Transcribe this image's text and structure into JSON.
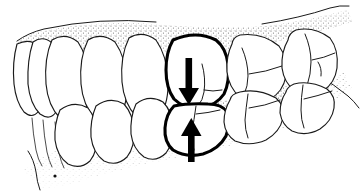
{
  "figure": {
    "domain": "medical-illustration",
    "caption": "",
    "annotations": {
      "down_arrow_label": "occlusal-force-down",
      "up_arrow_label": "occlusal-force-up",
      "highlighted_pair_label": "highlighted-occluding-tooth-pair"
    }
  },
  "canvas": {
    "width": 363,
    "height": 195,
    "background": "#ffffff"
  },
  "colors": {
    "background": "#ffffff",
    "outline": "#1a1a1a",
    "bold_outline": "#000000",
    "arrow": "#000000",
    "gum_stipple": "#555555",
    "tooth_fill": "#ffffff"
  },
  "arrows": [
    {
      "name": "down-arrow",
      "direction": "down",
      "tip_x": 189,
      "tip_y": 103,
      "tail_x": 189,
      "tail_y": 63
    },
    {
      "name": "up-arrow",
      "direction": "up",
      "tip_x": 191,
      "tip_y": 117,
      "tail_x": 191,
      "tail_y": 160
    }
  ],
  "upper_teeth": [
    {
      "name": "upper-incisor-1",
      "index": 1
    },
    {
      "name": "upper-incisor-2",
      "index": 2
    },
    {
      "name": "upper-canine",
      "index": 3
    },
    {
      "name": "upper-premolar-1",
      "index": 4
    },
    {
      "name": "upper-premolar-2",
      "index": 5
    },
    {
      "name": "upper-molar-1-highlighted",
      "index": 6,
      "highlighted": true
    },
    {
      "name": "upper-molar-2",
      "index": 7
    },
    {
      "name": "upper-molar-3",
      "index": 8
    }
  ],
  "lower_teeth": [
    {
      "name": "lower-incisor-1",
      "index": 1
    },
    {
      "name": "lower-incisor-2",
      "index": 2
    },
    {
      "name": "lower-canine",
      "index": 3
    },
    {
      "name": "lower-premolar-1",
      "index": 4
    },
    {
      "name": "lower-premolar-2",
      "index": 5
    },
    {
      "name": "lower-molar-1-highlighted",
      "index": 6,
      "highlighted": true
    },
    {
      "name": "lower-molar-2",
      "index": 7
    },
    {
      "name": "lower-molar-3",
      "index": 8
    }
  ],
  "gingiva": {
    "upper_label": "upper-gingiva-stipple",
    "lower_label": "lower-gingiva-stipple"
  }
}
